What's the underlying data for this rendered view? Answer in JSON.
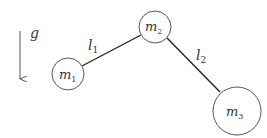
{
  "diagram": {
    "type": "double-pendulum-like mass chain",
    "gravity": {
      "label": "g",
      "direction": "down"
    },
    "masses": [
      {
        "id": "m1",
        "label": "m",
        "sub": "1",
        "cx": 68,
        "cy": 74,
        "r": 16
      },
      {
        "id": "m2",
        "label": "m",
        "sub": "2",
        "cx": 155,
        "cy": 27,
        "r": 16
      },
      {
        "id": "m3",
        "label": "m",
        "sub": "3",
        "cx": 237,
        "cy": 111,
        "r": 24
      }
    ],
    "links": [
      {
        "id": "l1",
        "label": "l",
        "sub": "1",
        "from": "m1",
        "to": "m2"
      },
      {
        "id": "l2",
        "label": "l",
        "sub": "2",
        "from": "m2",
        "to": "m3"
      }
    ],
    "colors": {
      "stroke": "#333333",
      "circle": "#555555",
      "background": "#ffffff"
    }
  }
}
